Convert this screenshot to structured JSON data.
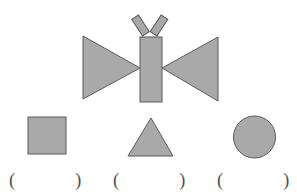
{
  "colors": {
    "fill": "#a9a9a9",
    "stroke": "#5a5a5a",
    "background": "#ffffff"
  },
  "figure": {
    "parts": [
      {
        "name": "left-wing",
        "shape": "triangle"
      },
      {
        "name": "right-wing",
        "shape": "triangle"
      },
      {
        "name": "body",
        "shape": "rectangle"
      },
      {
        "name": "left-antenna",
        "shape": "rectangle"
      },
      {
        "name": "right-antenna",
        "shape": "rectangle"
      }
    ]
  },
  "options": [
    {
      "shape": "square",
      "open": "(",
      "close": ")",
      "answer": ""
    },
    {
      "shape": "triangle",
      "open": "(",
      "close": ")",
      "answer": ""
    },
    {
      "shape": "circle",
      "open": "(",
      "close": ")",
      "answer": ""
    }
  ]
}
